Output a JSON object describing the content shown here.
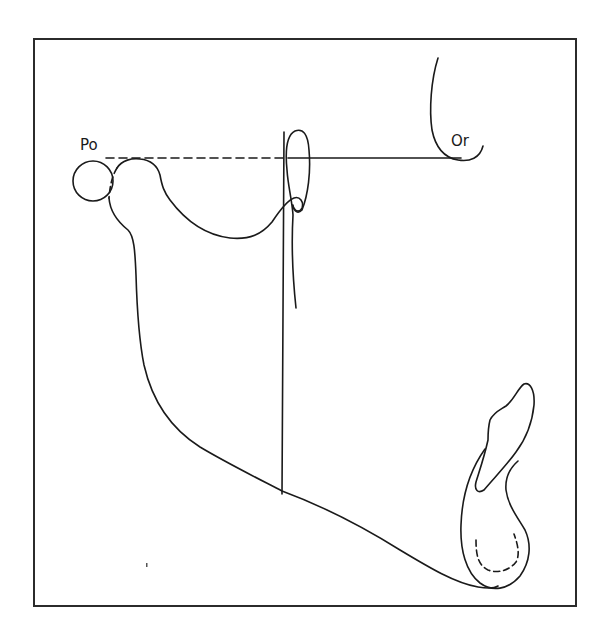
{
  "diagram": {
    "type": "cephalometric-tracing",
    "labels": {
      "porion": "Po",
      "orbitale": "Or"
    },
    "lines": {
      "frankfort_horizontal_dashed_segment": "Po to ramus",
      "frankfort_horizontal_solid_segment": "ramus to Or",
      "vertical_perpendicular": "from Frankfort plane to mandibular lower border"
    },
    "structures": [
      "porion-circle",
      "mandibular-condyle",
      "sigmoid-notch",
      "coronoid-process",
      "ramus-posterior-border",
      "mandibular-lower-border",
      "symphysis",
      "lower-incisor",
      "orbit-rim",
      "pterygomaxillary-fissure"
    ],
    "colors": {
      "stroke": "#1a1a1a",
      "background": "#ffffff",
      "frame": "#2b2b2b"
    }
  }
}
